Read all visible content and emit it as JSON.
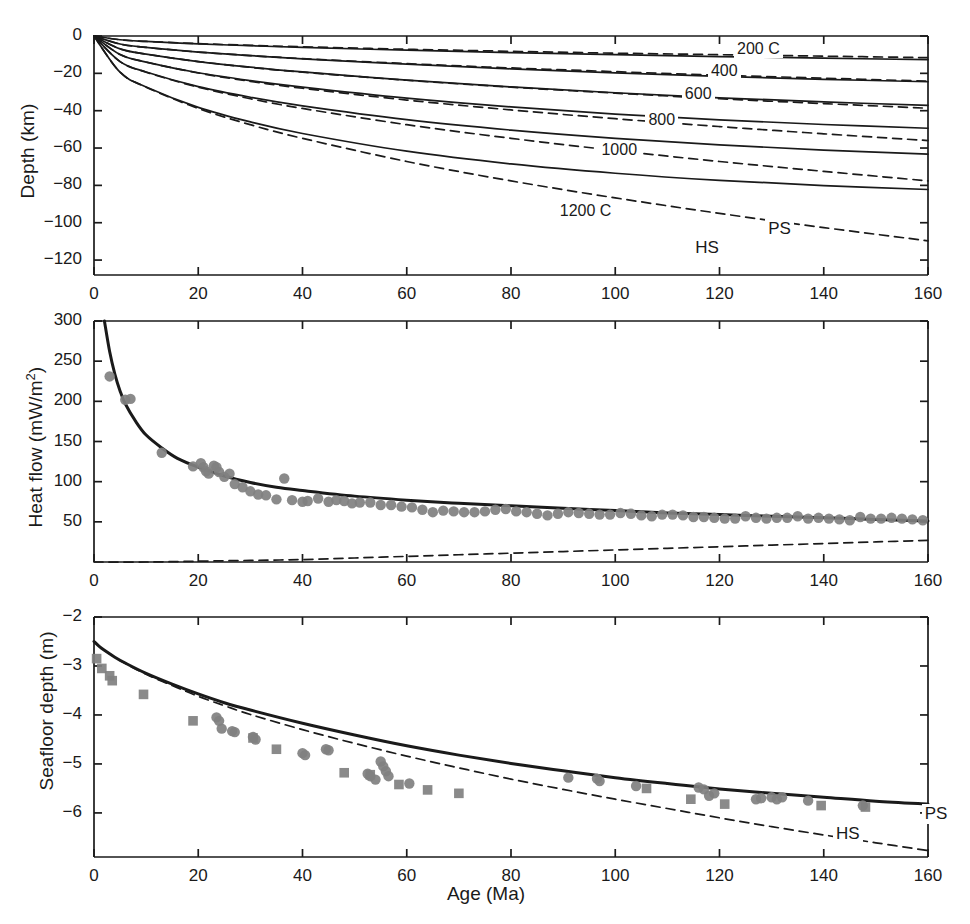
{
  "figure": {
    "xlabel": "Age (Ma)",
    "x_ticks": [
      0,
      20,
      40,
      60,
      80,
      100,
      120,
      140,
      160
    ],
    "xlim": [
      0,
      160
    ],
    "model_labels": {
      "plate": "PS",
      "halfspace": "HS"
    },
    "colors": {
      "line": "#1a1a1a",
      "marker": "#808080",
      "axis": "#1a1a1a",
      "background": "#ffffff"
    }
  },
  "chart_data": [
    {
      "type": "line",
      "panel": "top",
      "title": "",
      "xlabel": "",
      "ylabel": "Depth (km)",
      "xlim": [
        0,
        160
      ],
      "ylim": [
        -128,
        0
      ],
      "x_ticks": [
        0,
        20,
        40,
        60,
        80,
        100,
        120,
        140,
        160
      ],
      "y_ticks": [
        0,
        -20,
        -40,
        -60,
        -80,
        -100,
        -120
      ],
      "y_tick_labels": [
        "0",
        "−20",
        "−40",
        "−60",
        "−80",
        "−100",
        "−120"
      ],
      "grid": false,
      "legend": [
        "PS",
        "HS"
      ],
      "legend_position": "inside-right",
      "annotations": [
        {
          "text": "200 C",
          "x": 127,
          "y": -8
        },
        {
          "text": "400",
          "x": 122,
          "y": -20
        },
        {
          "text": "600",
          "x": 117,
          "y": -32
        },
        {
          "text": "800",
          "x": 110,
          "y": -46
        },
        {
          "text": "1000",
          "x": 101,
          "y": -62
        },
        {
          "text": "1200 C",
          "x": 93,
          "y": -95
        },
        {
          "text": "PS",
          "x": 133,
          "y": -104
        },
        {
          "text": "HS",
          "x": 119,
          "y": -114
        }
      ],
      "series": [
        {
          "name": "200 C isotherm (PS)",
          "style": "solid",
          "x": [
            0,
            5,
            10,
            20,
            30,
            40,
            60,
            80,
            100,
            120,
            140,
            160
          ],
          "y": [
            0,
            -2.0,
            -2.9,
            -4.2,
            -5.2,
            -6.1,
            -7.6,
            -8.9,
            -10.0,
            -11.0,
            -11.9,
            -12.6
          ]
        },
        {
          "name": "200 C isotherm (HS)",
          "style": "dashed",
          "x": [
            0,
            5,
            10,
            20,
            30,
            40,
            60,
            80,
            100,
            120,
            140,
            160
          ],
          "y": [
            0,
            -2.0,
            -2.9,
            -4.1,
            -5.0,
            -5.8,
            -7.1,
            -8.2,
            -9.2,
            -10.0,
            -10.8,
            -11.6
          ]
        },
        {
          "name": "400 C isotherm (PS)",
          "style": "solid",
          "x": [
            0,
            5,
            10,
            20,
            30,
            40,
            60,
            80,
            100,
            120,
            140,
            160
          ],
          "y": [
            0,
            -4.3,
            -6.1,
            -8.6,
            -10.5,
            -12.2,
            -15.1,
            -17.6,
            -19.7,
            -21.6,
            -23.2,
            -24.5
          ]
        },
        {
          "name": "400 C isotherm (HS)",
          "style": "dashed",
          "x": [
            0,
            5,
            10,
            20,
            30,
            40,
            60,
            80,
            100,
            120,
            140,
            160
          ],
          "y": [
            0,
            -4.3,
            -6.1,
            -8.6,
            -10.5,
            -12.1,
            -14.8,
            -17.1,
            -19.1,
            -21.0,
            -22.6,
            -24.2
          ]
        },
        {
          "name": "600 C isotherm (PS)",
          "style": "solid",
          "x": [
            0,
            5,
            10,
            20,
            30,
            40,
            60,
            80,
            100,
            120,
            140,
            160
          ],
          "y": [
            0,
            -6.9,
            -9.7,
            -13.7,
            -16.7,
            -19.2,
            -23.6,
            -27.3,
            -30.4,
            -33.1,
            -35.3,
            -37.2
          ]
        },
        {
          "name": "600 C isotherm (HS)",
          "style": "dashed",
          "x": [
            0,
            5,
            10,
            20,
            30,
            40,
            60,
            80,
            100,
            120,
            140,
            160
          ],
          "y": [
            0,
            -6.9,
            -9.7,
            -13.7,
            -16.8,
            -19.4,
            -23.7,
            -27.4,
            -30.6,
            -33.6,
            -36.2,
            -38.7
          ]
        },
        {
          "name": "800 C isotherm (PS)",
          "style": "solid",
          "x": [
            0,
            5,
            10,
            20,
            30,
            40,
            60,
            80,
            100,
            120,
            140,
            160
          ],
          "y": [
            0,
            -9.9,
            -14.0,
            -19.7,
            -23.9,
            -27.4,
            -33.3,
            -38.0,
            -41.8,
            -44.9,
            -47.4,
            -49.4
          ]
        },
        {
          "name": "800 C isotherm (HS)",
          "style": "dashed",
          "x": [
            0,
            5,
            10,
            20,
            30,
            40,
            60,
            80,
            100,
            120,
            140,
            160
          ],
          "y": [
            0,
            -9.9,
            -14.0,
            -19.8,
            -24.3,
            -28.0,
            -34.3,
            -39.6,
            -44.3,
            -48.5,
            -52.4,
            -56.0
          ]
        },
        {
          "name": "1000 C isotherm (PS)",
          "style": "solid",
          "x": [
            0,
            5,
            10,
            20,
            30,
            40,
            60,
            80,
            100,
            120,
            140,
            160
          ],
          "y": [
            0,
            -13.7,
            -19.3,
            -27.1,
            -32.8,
            -37.4,
            -44.8,
            -50.4,
            -54.8,
            -58.3,
            -61.1,
            -63.3
          ]
        },
        {
          "name": "1000 C isotherm (HS)",
          "style": "dashed",
          "x": [
            0,
            5,
            10,
            20,
            30,
            40,
            60,
            80,
            100,
            120,
            140,
            160
          ],
          "y": [
            0,
            -13.7,
            -19.4,
            -27.4,
            -33.6,
            -38.8,
            -47.5,
            -54.8,
            -61.3,
            -67.2,
            -72.5,
            -77.6
          ]
        },
        {
          "name": "1200 C isotherm (PS)",
          "style": "solid",
          "x": [
            0,
            5,
            10,
            20,
            30,
            40,
            60,
            80,
            100,
            120,
            140,
            160
          ],
          "y": [
            0,
            -19.4,
            -27.3,
            -38.2,
            -46.0,
            -52.2,
            -61.7,
            -68.5,
            -73.5,
            -77.3,
            -80.1,
            -82.2
          ]
        },
        {
          "name": "1200 C isotherm (HS)",
          "style": "dashed",
          "x": [
            0,
            5,
            10,
            20,
            30,
            40,
            60,
            80,
            100,
            120,
            140,
            160
          ],
          "y": [
            0,
            -19.4,
            -27.4,
            -38.8,
            -47.5,
            -54.8,
            -67.2,
            -77.6,
            -86.7,
            -95.0,
            -102.6,
            -109.7
          ]
        }
      ]
    },
    {
      "type": "scatter",
      "panel": "middle",
      "title": "",
      "xlabel": "",
      "ylabel": "Heat flow (mW/m2)",
      "ylabel_html": "Heat flow (mW/m<sup>2</sup>)",
      "xlim": [
        0,
        160
      ],
      "ylim": [
        0,
        300
      ],
      "x_ticks": [
        0,
        20,
        40,
        60,
        80,
        100,
        120,
        140,
        160
      ],
      "x_tick_labels": [
        "0",
        "20",
        "40",
        "60",
        "80",
        "100",
        "120",
        "140",
        "160"
      ],
      "y_ticks": [
        50,
        100,
        150,
        200,
        250,
        300
      ],
      "y_tick_labels": [
        "50",
        "100",
        "150",
        "200",
        "250",
        "300"
      ],
      "grid": false,
      "legend": [
        "PS",
        "HS"
      ],
      "series": [
        {
          "name": "Plate model heat flow (PS)",
          "style": "solid-thick",
          "x": [
            2,
            3,
            4,
            5,
            6,
            8,
            10,
            13,
            16,
            20,
            25,
            30,
            35,
            40,
            50,
            60,
            70,
            80,
            90,
            100,
            110,
            120,
            130,
            140,
            150,
            160
          ],
          "y": [
            300,
            262,
            234,
            213,
            197,
            175,
            158,
            142,
            129,
            118,
            107,
            99,
            93,
            89,
            82,
            77,
            73,
            70,
            67,
            64,
            61,
            59,
            57,
            55,
            53,
            51
          ]
        },
        {
          "name": "Half-space heat flow (HS)",
          "style": "dashed",
          "x": [
            0,
            10,
            20,
            30,
            40,
            50,
            60,
            70,
            80,
            90,
            100,
            110,
            120,
            130,
            140,
            150,
            160
          ],
          "y": [
            0,
            0,
            1,
            2,
            3,
            5,
            7,
            9,
            11,
            13,
            15,
            17,
            19,
            21,
            23,
            25,
            27
          ]
        },
        {
          "name": "Heat flow observations",
          "style": "marker-circle",
          "x": [
            3,
            6,
            7,
            13,
            19,
            20.5,
            21,
            21.5,
            22,
            23,
            23.5,
            24,
            25,
            26,
            27,
            28.5,
            30,
            31.5,
            33,
            35,
            36.5,
            38,
            40,
            41,
            43,
            45,
            46.5,
            48,
            49.5,
            51,
            53,
            55,
            57,
            59,
            61,
            63,
            65,
            67,
            69,
            71,
            73,
            75,
            77,
            79,
            81,
            83,
            85,
            87,
            89,
            91,
            93,
            95,
            97,
            99,
            101,
            103,
            105,
            107,
            109,
            111,
            113,
            115,
            117,
            119,
            121,
            123,
            125,
            127,
            129,
            131,
            133,
            135,
            137,
            139,
            141,
            143,
            145,
            147,
            149,
            151,
            153,
            155,
            157,
            159
          ],
          "y": [
            231,
            202,
            203,
            136,
            119,
            123,
            118,
            113,
            110,
            120,
            118,
            112,
            106,
            110,
            97,
            93,
            88,
            84,
            83,
            78,
            104,
            77,
            75,
            76,
            79,
            75,
            77,
            76,
            73,
            74,
            74,
            71,
            71,
            69,
            68,
            65,
            62,
            64,
            63,
            62,
            62,
            63,
            65,
            66,
            63,
            62,
            60,
            58,
            60,
            62,
            61,
            60,
            59,
            59,
            61,
            60,
            58,
            57,
            59,
            59,
            58,
            56,
            56,
            55,
            54,
            54,
            57,
            55,
            54,
            55,
            55,
            57,
            54,
            55,
            54,
            53,
            52,
            56,
            54,
            54,
            55,
            54,
            53,
            52
          ]
        }
      ]
    },
    {
      "type": "scatter",
      "panel": "bottom",
      "title": "",
      "xlabel": "Age (Ma)",
      "ylabel": "Seafloor depth (m)",
      "xlim": [
        0,
        160
      ],
      "ylim": [
        -6.9,
        -2
      ],
      "x_ticks": [
        0,
        20,
        40,
        60,
        80,
        100,
        120,
        140,
        160
      ],
      "y_ticks": [
        -2,
        -3,
        -4,
        -5,
        -6
      ],
      "y_tick_labels": [
        "−2",
        "−3",
        "−4",
        "−5",
        "−6"
      ],
      "grid": false,
      "legend": [
        "PS",
        "HS"
      ],
      "annotations": [
        {
          "text": "PS",
          "x": 163,
          "y": -6.05
        },
        {
          "text": "HS",
          "x": 146,
          "y": -6.45
        }
      ],
      "series": [
        {
          "name": "Plate model depth (PS)",
          "style": "solid-thick",
          "x": [
            0,
            1,
            2,
            4,
            6,
            10,
            15,
            20,
            25,
            30,
            40,
            50,
            60,
            70,
            80,
            90,
            100,
            110,
            120,
            130,
            140,
            150,
            160
          ],
          "y": [
            -2.5,
            -2.6,
            -2.68,
            -2.82,
            -2.94,
            -3.15,
            -3.37,
            -3.57,
            -3.75,
            -3.9,
            -4.17,
            -4.41,
            -4.63,
            -4.82,
            -4.99,
            -5.14,
            -5.28,
            -5.4,
            -5.51,
            -5.6,
            -5.68,
            -5.76,
            -5.82
          ]
        },
        {
          "name": "Half-space depth (HS)",
          "style": "dashed",
          "x": [
            0,
            1,
            2,
            4,
            6,
            10,
            15,
            20,
            25,
            30,
            40,
            50,
            60,
            70,
            80,
            90,
            100,
            110,
            120,
            130,
            140,
            150,
            160
          ],
          "y": [
            -2.5,
            -2.6,
            -2.68,
            -2.82,
            -2.95,
            -3.17,
            -3.4,
            -3.62,
            -3.81,
            -3.99,
            -4.3,
            -4.58,
            -4.84,
            -5.08,
            -5.31,
            -5.52,
            -5.72,
            -5.91,
            -6.1,
            -6.28,
            -6.45,
            -6.61,
            -6.77
          ]
        },
        {
          "name": "Depth observations (circles)",
          "style": "marker-circle",
          "x": [
            23.5,
            24,
            24.5,
            26.5,
            27,
            30.5,
            31,
            40,
            40.5,
            44.5,
            45,
            52.5,
            53,
            54,
            55,
            55.5,
            56,
            56.5,
            60.5,
            91,
            96.5,
            97,
            104,
            116,
            117,
            118,
            119,
            127,
            128,
            130,
            131,
            132,
            137,
            147.5
          ],
          "y": [
            -4.05,
            -4.12,
            -4.28,
            -4.33,
            -4.35,
            -4.45,
            -4.5,
            -4.78,
            -4.82,
            -4.7,
            -4.72,
            -5.2,
            -5.25,
            -5.32,
            -4.95,
            -5.05,
            -5.15,
            -5.25,
            -5.4,
            -5.28,
            -5.3,
            -5.35,
            -5.45,
            -5.48,
            -5.52,
            -5.65,
            -5.6,
            -5.72,
            -5.7,
            -5.68,
            -5.72,
            -5.68,
            -5.75,
            -5.85
          ]
        },
        {
          "name": "Depth observations (squares)",
          "style": "marker-square",
          "x": [
            0.5,
            1.5,
            3,
            3.5,
            9.5,
            19,
            30.5,
            35,
            48,
            53,
            58.5,
            64,
            70,
            106,
            114.5,
            121,
            139.5,
            148
          ],
          "y": [
            -2.85,
            -3.05,
            -3.2,
            -3.3,
            -3.58,
            -4.12,
            -4.47,
            -4.7,
            -5.18,
            -5.22,
            -5.42,
            -5.53,
            -5.6,
            -5.5,
            -5.72,
            -5.82,
            -5.85,
            -5.88
          ]
        }
      ]
    }
  ]
}
